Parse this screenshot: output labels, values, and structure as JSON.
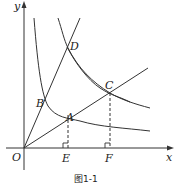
{
  "figure": {
    "caption": "图1-1",
    "axes": {
      "x_label": "x",
      "y_label": "y",
      "origin_label": "O"
    },
    "points": [
      {
        "name": "A",
        "x": 68,
        "y": 115
      },
      {
        "name": "B",
        "x": 45,
        "y": 104
      },
      {
        "name": "C",
        "x": 110,
        "y": 93
      },
      {
        "name": "D",
        "x": 67,
        "y": 47
      },
      {
        "name": "E",
        "x": 68,
        "y": 148
      },
      {
        "name": "F",
        "x": 110,
        "y": 148
      }
    ],
    "labels": {
      "A": "A",
      "B": "B",
      "C": "C",
      "D": "D",
      "E": "E",
      "F": "F"
    },
    "elements": [
      "line OD through B (y = k1 x)",
      "line OC through A (y = k2 x)",
      "hyperbola through B and A (inner)",
      "hyperbola through D and C (outer, two branches drawn)",
      "dashed perpendicular AE to x-axis with right-angle mark",
      "dashed perpendicular CF to x-axis with right-angle mark"
    ],
    "colors": {
      "stroke": "#333333",
      "background": "#ffffff"
    }
  }
}
